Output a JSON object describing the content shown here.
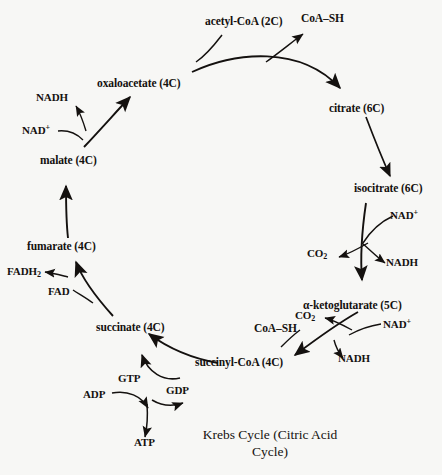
{
  "diagram": {
    "title": "Krebs Cycle (Citric Acid Cycle)",
    "caption_line1": "Krebs Cycle (Citric Acid",
    "caption_line2": "Cycle)",
    "background_color": "#f7f7f5",
    "ink_color": "#14110f"
  },
  "metabolites": {
    "acetyl_coa": "acetyl-CoA (2C)",
    "coa_sh_top": "CoA–SH",
    "citrate": "citrate (6C)",
    "isocitrate": "isocitrate (6C)",
    "alpha_ketoglutarate": "α-ketoglutarate (5C)",
    "succinyl_coa": "succinyl-CoA (4C)",
    "coa_sh_bottom": "CoA–SH",
    "succinate": "succinate (4C)",
    "fumarate": "fumarate (4C)",
    "malate": "malate (4C)",
    "oxaloacetate": "oxaloacetate (4C)"
  },
  "cofactors": {
    "nadh_malate": "NADH",
    "nad_plus_malate": "NAD",
    "nad_plus_malate_sup": "+",
    "nad_plus_isocitrate": "NAD",
    "nad_plus_isocitrate_sup": "+",
    "co2_isocitrate": "CO",
    "co2_isocitrate_sub": "2",
    "nadh_isocitrate": "NADH",
    "co2_akg": "CO",
    "co2_akg_sub": "2",
    "nad_plus_akg": "NAD",
    "nad_plus_akg_sup": "+",
    "nadh_akg": "NADH",
    "fadh2": "FADH",
    "fadh2_sub": "2",
    "fad": "FAD",
    "gtp": "GTP",
    "gdp": "GDP",
    "adp": "ADP",
    "atp": "ATP"
  }
}
